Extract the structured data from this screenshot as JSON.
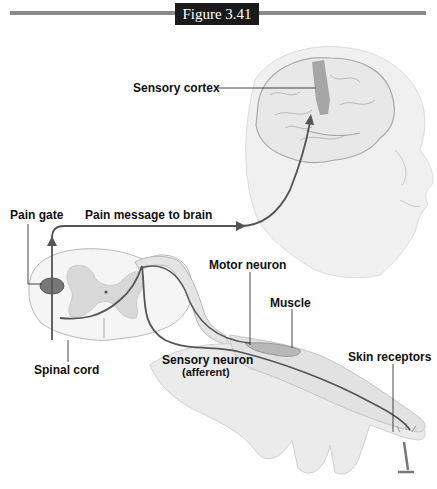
{
  "figure": {
    "title": "Figure 3.41"
  },
  "labels": {
    "sensory_cortex": "Sensory cortex",
    "pain_gate": "Pain gate",
    "pain_message": "Pain message to brain",
    "motor_neuron": "Motor neuron",
    "muscle": "Muscle",
    "spinal_cord": "Spinal cord",
    "sensory_neuron": "Sensory neuron",
    "sensory_neuron_sub": "(afferent)",
    "skin_receptors": "Skin receptors"
  },
  "colors": {
    "rule": "#8a8a8a",
    "title_bg": "#1a1a1a",
    "cortex": "#9a9a9a",
    "pathway": "#555555",
    "skin": "#e6e6e6"
  }
}
